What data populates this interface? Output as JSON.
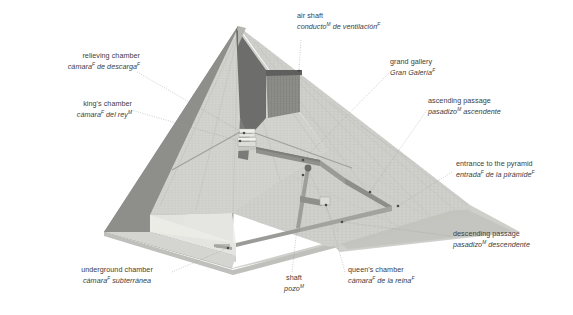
{
  "figure": {
    "background_color": "#ffffff",
    "text_color": "#3d3d3d",
    "leader_line_color": "#8b8b8b"
  },
  "palette": {
    "face_light": "#e9e9e7",
    "face_dark": "#8f8f8f",
    "face_mid": "#c9c9c6",
    "core_hatch": "#c2c2be",
    "shadow": "#bdbdba",
    "ground": "#d8d8d4",
    "passage": "#8a8a88",
    "cavity_dark": "#6f6f6f"
  },
  "labels": [
    {
      "id": "relieving-chamber",
      "en": "relieving chamber",
      "es_pre": "cámara",
      "es_sup1": "F",
      "es_mid": " de descarga",
      "es_sup2": "F",
      "es_post": ""
    },
    {
      "id": "kings-chamber",
      "en": "king's chamber",
      "es_pre": "cámara",
      "es_sup1": "F",
      "es_mid": " del rey",
      "es_sup2": "M",
      "es_post": ""
    },
    {
      "id": "air-shaft",
      "en": "air shaft",
      "es_pre": "conducto",
      "es_sup1": "M",
      "es_mid": " de ventilación",
      "es_sup2": "F",
      "es_post": ""
    },
    {
      "id": "grand-gallery",
      "en": "grand gallery",
      "es_pre": "Gran Galería",
      "es_sup1": "F",
      "es_mid": "",
      "es_sup2": "",
      "es_post": ""
    },
    {
      "id": "ascending-passage",
      "en": "ascending passage",
      "es_pre": "pasadizo",
      "es_sup1": "M",
      "es_mid": " ascendente",
      "es_sup2": "",
      "es_post": ""
    },
    {
      "id": "entrance-to-the-pyramid",
      "en": "entrance to the pyramid",
      "es_pre": "entrada",
      "es_sup1": "F",
      "es_mid": " de la pirámide",
      "es_sup2": "F",
      "es_post": ""
    },
    {
      "id": "descending-passage",
      "en": "descending passage",
      "es_pre": "pasadizo",
      "es_sup1": "M",
      "es_mid": " descendente",
      "es_sup2": "",
      "es_post": ""
    },
    {
      "id": "queens-chamber",
      "en": "queen's chamber",
      "es_pre": "cámara",
      "es_sup1": "F",
      "es_mid": " de la reina",
      "es_sup2": "F",
      "es_post": ""
    },
    {
      "id": "shaft",
      "en": "shaft",
      "es_pre": "pozo",
      "es_sup1": "M",
      "es_mid": "",
      "es_sup2": "",
      "es_post": ""
    },
    {
      "id": "underground-chamber",
      "en": "underground chamber",
      "es_pre": "cámara",
      "es_sup1": "F",
      "es_mid": " subterránea",
      "es_sup2": "",
      "es_post": ""
    }
  ]
}
